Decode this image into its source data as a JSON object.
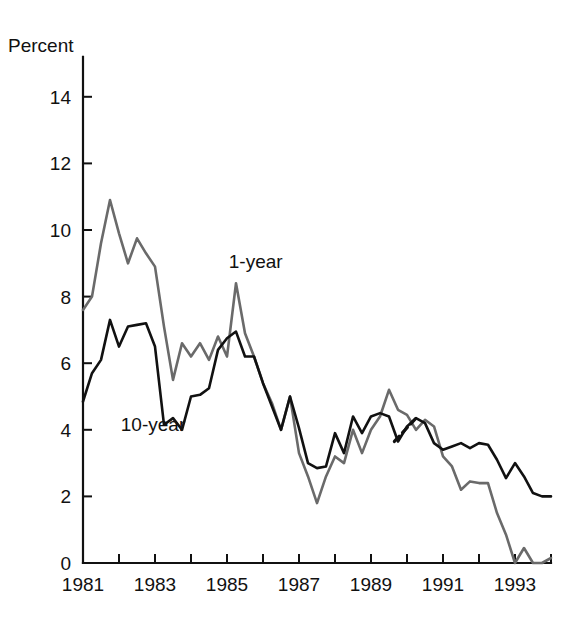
{
  "chart_data": {
    "type": "line",
    "title": "",
    "xlabel": "",
    "ylabel": "Percent",
    "ylim": [
      0,
      15.2
    ],
    "xlim": [
      1981.0,
      1994.0
    ],
    "grid": false,
    "legend": "inline-annotations",
    "yticks": [
      0,
      2,
      4,
      6,
      8,
      10,
      12,
      14
    ],
    "ytick_labels": [
      "0",
      "2",
      "4",
      "6",
      "8",
      "10",
      "12",
      "14"
    ],
    "xticks": [
      1981,
      1982,
      1983,
      1984,
      1985,
      1986,
      1987,
      1988,
      1989,
      1990,
      1991,
      1992,
      1993,
      1994
    ],
    "xtick_labels": [
      "1981",
      "",
      "1983",
      "",
      "1985",
      "",
      "1987",
      "",
      "1989",
      "",
      "1991",
      "",
      "1993",
      ""
    ],
    "annotations": [
      {
        "text": "1-year",
        "x": 1985.05,
        "y": 8.85
      },
      {
        "text": "10-year",
        "x": 1982.05,
        "y": 3.95
      }
    ],
    "series": [
      {
        "name": "1-year",
        "color": "#6a6a6a",
        "linestyle": "solid",
        "linewidth": 2.6,
        "x": [
          1981.0,
          1981.25,
          1981.5,
          1981.75,
          1982.0,
          1982.25,
          1982.5,
          1982.75,
          1983.0,
          1983.25,
          1983.5,
          1983.75,
          1984.0,
          1984.25,
          1984.5,
          1984.75,
          1985.0,
          1985.25,
          1985.5,
          1985.75,
          1986.0,
          1986.25,
          1986.5,
          1986.75,
          1987.0,
          1987.25,
          1987.5,
          1987.75,
          1988.0,
          1988.25,
          1988.5,
          1988.75,
          1989.0,
          1989.25,
          1989.5,
          1989.75,
          1990.0,
          1990.25,
          1990.5,
          1990.75,
          1991.0,
          1991.25,
          1991.5,
          1991.75,
          1992.0,
          1992.25,
          1992.5,
          1992.75,
          1993.0,
          1993.25,
          1993.5,
          1993.75,
          1994.0
        ],
        "y": [
          7.6,
          8.0,
          9.6,
          10.9,
          9.9,
          9.0,
          9.75,
          9.3,
          8.9,
          7.1,
          5.5,
          6.6,
          6.2,
          6.6,
          6.1,
          6.8,
          6.2,
          8.4,
          6.9,
          6.2,
          5.4,
          4.8,
          4.0,
          5.0,
          3.3,
          2.6,
          1.8,
          2.6,
          3.2,
          3.0,
          4.0,
          3.3,
          4.0,
          4.4,
          5.2,
          4.6,
          4.45,
          4.0,
          4.3,
          4.1,
          3.2,
          2.9,
          2.2,
          2.45,
          2.4,
          2.4,
          1.5,
          0.85,
          0.0,
          0.45,
          0.0,
          0.0,
          0.15
        ]
      },
      {
        "name": "10-year",
        "color": "#111111",
        "linestyle": "solid",
        "linewidth": 2.6,
        "dashed_segment": {
          "x_start": 1989.65,
          "x_end": 1990.25,
          "y_start": 3.65,
          "y_end": 4.35
        },
        "x": [
          1981.0,
          1981.25,
          1981.5,
          1981.75,
          1982.0,
          1982.25,
          1982.5,
          1982.75,
          1983.0,
          1983.25,
          1983.5,
          1983.75,
          1984.0,
          1984.25,
          1984.5,
          1984.75,
          1985.0,
          1985.25,
          1985.5,
          1985.75,
          1986.0,
          1986.25,
          1986.5,
          1986.75,
          1987.0,
          1987.25,
          1987.5,
          1987.75,
          1988.0,
          1988.25,
          1988.5,
          1988.75,
          1989.0,
          1989.25,
          1989.5,
          1989.75,
          1990.0,
          1990.25,
          1990.5,
          1990.75,
          1991.0,
          1991.25,
          1991.5,
          1991.75,
          1992.0,
          1992.25,
          1992.5,
          1992.75,
          1993.0,
          1993.25,
          1993.5,
          1993.75,
          1994.0
        ],
        "y": [
          4.85,
          5.7,
          6.1,
          7.3,
          6.5,
          7.1,
          7.15,
          7.2,
          6.5,
          4.15,
          4.35,
          4.0,
          5.0,
          5.05,
          5.25,
          6.4,
          6.75,
          6.95,
          6.2,
          6.2,
          5.4,
          4.7,
          4.0,
          5.0,
          4.05,
          3.0,
          2.85,
          2.9,
          3.9,
          3.3,
          4.4,
          3.9,
          4.4,
          4.5,
          4.4,
          3.65,
          4.1,
          4.35,
          4.2,
          3.6,
          3.4,
          3.5,
          3.6,
          3.45,
          3.6,
          3.55,
          3.1,
          2.55,
          3.0,
          2.6,
          2.1,
          2.0,
          2.0
        ]
      }
    ]
  },
  "axis": {
    "y_axis_name": "y-axis",
    "x_axis_name": "x-axis"
  }
}
